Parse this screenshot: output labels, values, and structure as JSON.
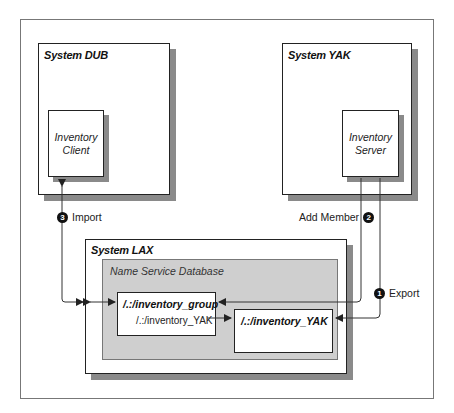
{
  "diagram": {
    "systems": {
      "dub": {
        "title": "System DUB",
        "component": {
          "line1": "Inventory",
          "line2": "Client"
        }
      },
      "yak": {
        "title": "System YAK",
        "component": {
          "line1": "Inventory",
          "line2": "Server"
        }
      },
      "lax": {
        "title": "System LAX",
        "database": {
          "label": "Name Service Database",
          "entries": [
            {
              "title": "/.:/inventory_group",
              "member": "/.:/inventory_YAK"
            },
            {
              "title": "/.:/inventory_YAK"
            }
          ]
        }
      }
    },
    "steps": [
      {
        "number": "1",
        "label": "Export"
      },
      {
        "number": "2",
        "label": "Add Member"
      },
      {
        "number": "3",
        "label": "Import"
      }
    ],
    "colors": {
      "line": "#333333",
      "shadow": "#8a8a8a",
      "database_fill": "#cfcfcf"
    }
  }
}
